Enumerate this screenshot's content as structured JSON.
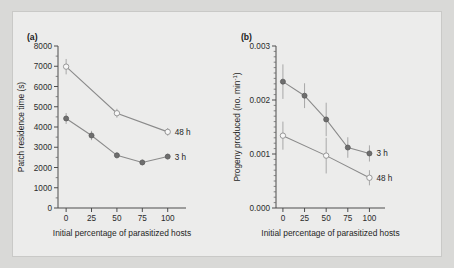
{
  "figure": {
    "background_color": "#d9d9d7",
    "plate_color": "#ececeb",
    "line_color": "#8a8a8a",
    "marker_filled_color": "#6e6e6e",
    "marker_open_color": "#f7f7f7"
  },
  "chart_data": [
    {
      "type": "line",
      "panel_tag": "(a)",
      "title": "",
      "xlabel": "Initial percentage of parasitized hosts",
      "ylabel": "Patch residence time (s)",
      "xlim": [
        -8,
        118
      ],
      "ylim": [
        0,
        8000
      ],
      "xticks": [
        0,
        25,
        50,
        75,
        100
      ],
      "xtick_labels": [
        "0",
        "25",
        "50",
        "75",
        "100"
      ],
      "yticks": [
        0,
        1000,
        2000,
        3000,
        4000,
        5000,
        6000,
        7000,
        8000
      ],
      "ytick_labels": [
        "0",
        "1000",
        "2000",
        "3000",
        "4000",
        "5000",
        "6000",
        "7000",
        "8000"
      ],
      "grid": false,
      "legend_position": "right-inline",
      "series": [
        {
          "name": "48 h",
          "marker": "open-circle",
          "x": [
            0,
            50,
            100
          ],
          "values": [
            6980,
            4680,
            3760
          ],
          "error": [
            380,
            220,
            190
          ]
        },
        {
          "name": "3 h",
          "marker": "filled-circle",
          "x": [
            0,
            25,
            50,
            75,
            100
          ],
          "values": [
            4420,
            3580,
            2600,
            2250,
            2540
          ],
          "error": [
            270,
            230,
            150,
            140,
            140
          ]
        }
      ]
    },
    {
      "type": "line",
      "panel_tag": "(b)",
      "title": "",
      "xlabel": "Initial percentage of parasitized hosts",
      "ylabel": "Progeny produced (no. min",
      "ylabel_sup": "-1",
      "ylabel_tail": ")",
      "xlim": [
        -8,
        118
      ],
      "ylim": [
        0.0,
        0.003
      ],
      "xticks": [
        0,
        25,
        50,
        75,
        100
      ],
      "xtick_labels": [
        "0",
        "25",
        "50",
        "75",
        "100"
      ],
      "yticks": [
        0.0,
        0.001,
        0.002,
        0.003
      ],
      "ytick_labels": [
        "0.000",
        "0.001",
        "0.002",
        "0.003"
      ],
      "grid": false,
      "legend_position": "right-inline",
      "series": [
        {
          "name": "3 h",
          "marker": "filled-circle",
          "x": [
            0,
            25,
            50,
            75,
            100
          ],
          "values": [
            0.00234,
            0.00208,
            0.00164,
            0.00112,
            0.00101
          ],
          "error": [
            0.00032,
            0.00023,
            0.00031,
            0.00019,
            0.00015
          ]
        },
        {
          "name": "48 h",
          "marker": "open-circle",
          "x": [
            0,
            50,
            100
          ],
          "values": [
            0.00134,
            0.00097,
            0.00056
          ],
          "error": [
            0.00026,
            0.00033,
            0.00014
          ]
        }
      ]
    }
  ]
}
